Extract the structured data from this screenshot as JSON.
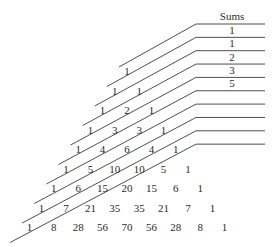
{
  "sums_header": "Sums",
  "sums": [
    "1",
    "1",
    "2",
    "3",
    "5",
    "",
    "",
    "",
    ""
  ],
  "rows": [
    [
      "1"
    ],
    [
      "1",
      "1"
    ],
    [
      "1",
      "2",
      "1"
    ],
    [
      "1",
      "3",
      "3",
      "1"
    ],
    [
      "1",
      "4",
      "6",
      "4",
      "1"
    ],
    [
      "1",
      "5",
      "10",
      "10",
      "5",
      "1"
    ],
    [
      "1",
      "6",
      "15",
      "20",
      "15",
      "6",
      "1"
    ],
    [
      "1",
      "7",
      "21",
      "35",
      "35",
      "21",
      "7",
      "1"
    ],
    [
      "1",
      "8",
      "28",
      "56",
      "70",
      "56",
      "28",
      "8",
      "1"
    ]
  ],
  "colors": {
    "line": "#3a3a3a",
    "text": "#2a2a2a",
    "background": "#ffffff"
  }
}
